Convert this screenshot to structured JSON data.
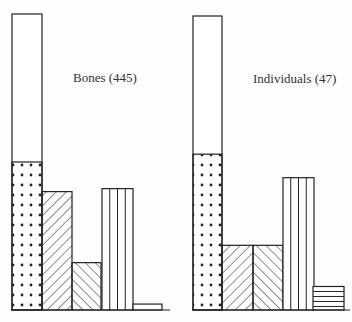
{
  "chart_data": {
    "type": "bar",
    "title": "",
    "xlabel": "",
    "ylabel": "",
    "ylim": [
      0,
      100
    ],
    "grid": false,
    "legend": "none",
    "unit": "percent of total (estimated from bar heights)",
    "categories": [
      "Total (open)",
      "Dotted",
      "Hatched /",
      "Hatched \\",
      "Vertical lines",
      "Horizontal lines"
    ],
    "groups": [
      {
        "name": "Bones",
        "label": "Bones (445)",
        "n": 445,
        "bars": [
          {
            "pattern": "open",
            "value": 100
          },
          {
            "pattern": "dots",
            "value": 50
          },
          {
            "pattern": "hatch-forward",
            "value": 40
          },
          {
            "pattern": "hatch-back",
            "value": 16
          },
          {
            "pattern": "vertical",
            "value": 41
          },
          {
            "pattern": "horizontal",
            "value": 2
          }
        ]
      },
      {
        "name": "Individuals",
        "label": "Individuals (47)",
        "n": 47,
        "bars": [
          {
            "pattern": "open",
            "value": 100
          },
          {
            "pattern": "dots",
            "value": 53
          },
          {
            "pattern": "hatch-forward",
            "value": 22
          },
          {
            "pattern": "hatch-back",
            "value": 22
          },
          {
            "pattern": "vertical",
            "value": 45
          },
          {
            "pattern": "horizontal",
            "value": 8
          }
        ]
      }
    ],
    "series": [
      {
        "name": "Bones (445)",
        "values": [
          100,
          50,
          40,
          16,
          41,
          2
        ]
      },
      {
        "name": "Individuals (47)",
        "values": [
          100,
          53,
          22,
          22,
          45,
          8
        ]
      }
    ]
  },
  "labels": {
    "bones": "Bones (445)",
    "individuals": "Individuals (47)"
  },
  "colors": {
    "stroke": "#222222",
    "background": "#fdfdfd"
  }
}
